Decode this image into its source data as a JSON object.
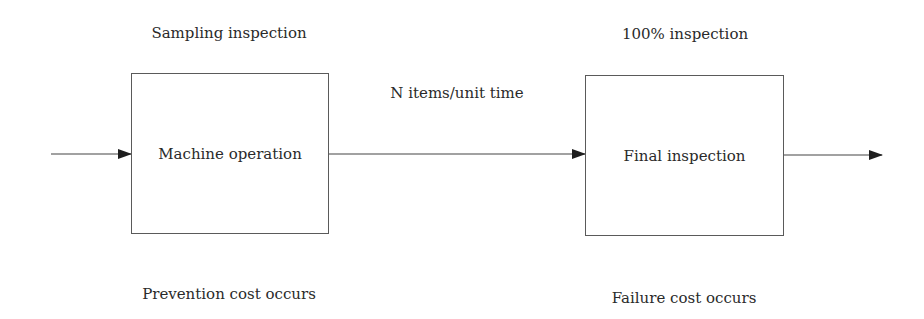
{
  "diagram": {
    "nodes": [
      {
        "id": "machine",
        "label": "Machine operation",
        "top_annotation": "Sampling inspection",
        "bottom_annotation": "Prevention cost occurs"
      },
      {
        "id": "final",
        "label": "Final inspection",
        "top_annotation": "100% inspection",
        "bottom_annotation": "Failure cost occurs"
      }
    ],
    "edges": [
      {
        "from": "input",
        "to": "machine",
        "label": ""
      },
      {
        "from": "machine",
        "to": "final",
        "label": "N items/unit time"
      },
      {
        "from": "final",
        "to": "output",
        "label": ""
      }
    ],
    "colors": {
      "line": "#444444",
      "border": "#5a5a5a",
      "text": "#2a2a2a",
      "background": "#ffffff"
    }
  }
}
